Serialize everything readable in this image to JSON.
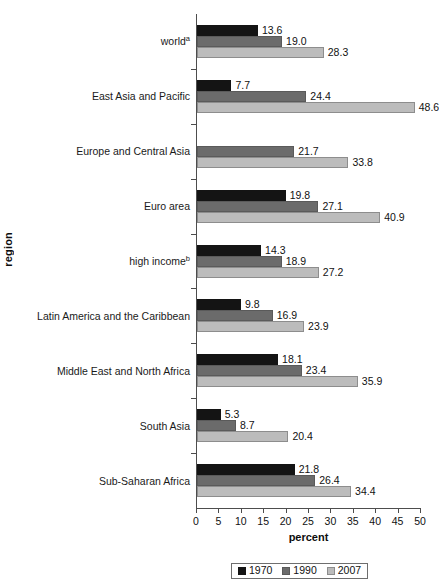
{
  "chart_data": {
    "type": "bar",
    "orientation": "horizontal",
    "title": "",
    "xlabel": "percent",
    "ylabel": "region",
    "xlim": [
      0,
      50
    ],
    "xticks": [
      0,
      5,
      10,
      15,
      20,
      25,
      30,
      35,
      40,
      45,
      50
    ],
    "grid": false,
    "legend_position": "bottom",
    "categories": [
      "world",
      "East Asia and Pacific",
      "Europe and Central Asia",
      "Euro area",
      "high income",
      "Latin America and the Caribbean",
      "Middle East and North Africa",
      "South Asia",
      "Sub-Saharan Africa"
    ],
    "category_footnotes": [
      "a",
      "",
      "",
      "",
      "b",
      "",
      "",
      "",
      ""
    ],
    "series": [
      {
        "name": "1970",
        "color": "#141414",
        "values": [
          13.6,
          7.7,
          null,
          19.8,
          14.3,
          9.8,
          18.1,
          5.3,
          21.8
        ],
        "labels": [
          "13.6",
          "7.7",
          "",
          "19.8",
          "14.3",
          "9.8",
          "18.1",
          "5.3",
          "21.8"
        ]
      },
      {
        "name": "1990",
        "color": "#6b6b6b",
        "values": [
          19.0,
          24.4,
          21.7,
          27.1,
          18.9,
          16.9,
          23.4,
          8.7,
          26.4
        ],
        "labels": [
          "19.0",
          "24.4",
          "21.7",
          "27.1",
          "18.9",
          "16.9",
          "23.4",
          "8.7",
          "26.4"
        ]
      },
      {
        "name": "2007",
        "color": "#bcbcbc",
        "values": [
          28.3,
          48.6,
          33.8,
          40.9,
          27.2,
          23.9,
          35.9,
          20.4,
          34.4
        ],
        "labels": [
          "28.3",
          "48.6",
          "33.8",
          "40.9",
          "27.2",
          "23.9",
          "35.9",
          "20.4",
          "34.4"
        ]
      }
    ]
  },
  "axes": {
    "x_title": "percent",
    "y_title": "region",
    "x_tick_labels": [
      "0",
      "5",
      "10",
      "15",
      "20",
      "25",
      "30",
      "35",
      "40",
      "45",
      "50"
    ]
  },
  "legend": {
    "items": [
      {
        "label": "1970",
        "swatch": "s1970"
      },
      {
        "label": "1990",
        "swatch": "s1990"
      },
      {
        "label": "2007",
        "swatch": "s2007"
      }
    ]
  }
}
